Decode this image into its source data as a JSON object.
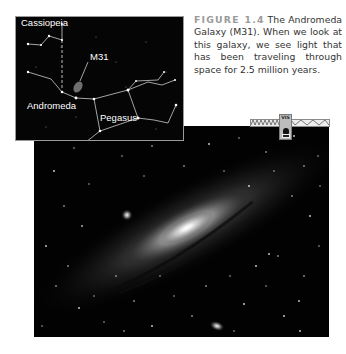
{
  "figure": {
    "number_label": "FIGURE 1.4",
    "caption_text": "The Andromeda Galaxy (M31). When we look at this galaxy, we see light that has been traveling through space for 2.5 million years."
  },
  "inset_map": {
    "labels": {
      "cassiopeia": "Cassiopeia",
      "m31": "M31",
      "andromeda": "Andromeda",
      "pegasus": "Pegasus"
    }
  },
  "spectrum_bar": {
    "band_label": "VIS",
    "icon": "eye-icon"
  },
  "colors": {
    "figure_label": "#9a9a9a",
    "caption_text": "#333333",
    "sky_background": "#020202",
    "map_lines": "#e8e8e8"
  }
}
